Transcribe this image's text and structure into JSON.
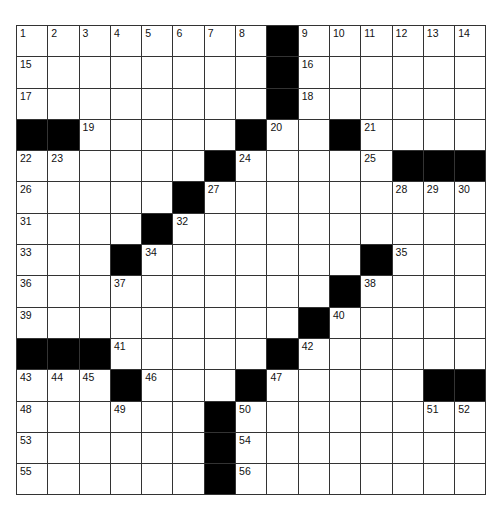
{
  "puzzle": {
    "rows": 15,
    "cols": 15,
    "colors": {
      "black": "#000000",
      "white": "#ffffff",
      "line": "#333333"
    },
    "black_cells": [
      [
        0,
        8
      ],
      [
        1,
        8
      ],
      [
        2,
        8
      ],
      [
        3,
        0
      ],
      [
        3,
        1
      ],
      [
        3,
        7
      ],
      [
        3,
        10
      ],
      [
        4,
        6
      ],
      [
        4,
        12
      ],
      [
        4,
        13
      ],
      [
        4,
        14
      ],
      [
        5,
        5
      ],
      [
        6,
        4
      ],
      [
        7,
        3
      ],
      [
        7,
        11
      ],
      [
        8,
        10
      ],
      [
        9,
        9
      ],
      [
        10,
        0
      ],
      [
        10,
        1
      ],
      [
        10,
        2
      ],
      [
        10,
        8
      ],
      [
        11,
        3
      ],
      [
        11,
        7
      ],
      [
        11,
        13
      ],
      [
        11,
        14
      ],
      [
        12,
        6
      ],
      [
        13,
        6
      ],
      [
        14,
        6
      ]
    ],
    "numbers": [
      [
        0,
        0,
        "1"
      ],
      [
        0,
        1,
        "2"
      ],
      [
        0,
        2,
        "3"
      ],
      [
        0,
        3,
        "4"
      ],
      [
        0,
        4,
        "5"
      ],
      [
        0,
        5,
        "6"
      ],
      [
        0,
        6,
        "7"
      ],
      [
        0,
        7,
        "8"
      ],
      [
        0,
        9,
        "9"
      ],
      [
        0,
        10,
        "10"
      ],
      [
        0,
        11,
        "11"
      ],
      [
        0,
        12,
        "12"
      ],
      [
        0,
        13,
        "13"
      ],
      [
        0,
        14,
        "14"
      ],
      [
        1,
        0,
        "15"
      ],
      [
        1,
        9,
        "16"
      ],
      [
        2,
        0,
        "17"
      ],
      [
        2,
        9,
        "18"
      ],
      [
        3,
        2,
        "19"
      ],
      [
        3,
        8,
        "20"
      ],
      [
        3,
        11,
        "21"
      ],
      [
        4,
        0,
        "22"
      ],
      [
        4,
        1,
        "23"
      ],
      [
        4,
        7,
        "24"
      ],
      [
        4,
        11,
        "25"
      ],
      [
        5,
        0,
        "26"
      ],
      [
        5,
        6,
        "27"
      ],
      [
        5,
        12,
        "28"
      ],
      [
        5,
        13,
        "29"
      ],
      [
        5,
        14,
        "30"
      ],
      [
        6,
        0,
        "31"
      ],
      [
        6,
        5,
        "32"
      ],
      [
        7,
        0,
        "33"
      ],
      [
        7,
        4,
        "34"
      ],
      [
        7,
        12,
        "35"
      ],
      [
        8,
        0,
        "36"
      ],
      [
        8,
        3,
        "37"
      ],
      [
        8,
        11,
        "38"
      ],
      [
        9,
        0,
        "39"
      ],
      [
        9,
        10,
        "40"
      ],
      [
        10,
        3,
        "41"
      ],
      [
        10,
        9,
        "42"
      ],
      [
        11,
        0,
        "43"
      ],
      [
        11,
        1,
        "44"
      ],
      [
        11,
        2,
        "45"
      ],
      [
        11,
        4,
        "46"
      ],
      [
        11,
        8,
        "47"
      ],
      [
        12,
        0,
        "48"
      ],
      [
        12,
        3,
        "49"
      ],
      [
        12,
        7,
        "50"
      ],
      [
        12,
        13,
        "51"
      ],
      [
        12,
        14,
        "52"
      ],
      [
        13,
        0,
        "53"
      ],
      [
        13,
        7,
        "54"
      ],
      [
        14,
        0,
        "55"
      ],
      [
        14,
        7,
        "56"
      ]
    ]
  }
}
